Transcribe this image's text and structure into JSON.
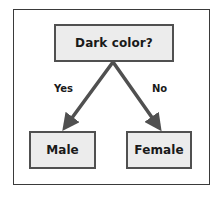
{
  "diagram": {
    "type": "decision-tree",
    "root": {
      "label": "Dark color?"
    },
    "edges": [
      {
        "label": "Yes",
        "from": "root",
        "to": "male"
      },
      {
        "label": "No",
        "from": "root",
        "to": "female"
      }
    ],
    "leaves": [
      {
        "id": "male",
        "label": "Male"
      },
      {
        "id": "female",
        "label": "Female"
      }
    ],
    "colors": {
      "node_fill": "#ececec",
      "node_border": "#505050",
      "arrow": "#505050",
      "text": "#1a1a1a",
      "frame": "#3a3a3a"
    }
  }
}
